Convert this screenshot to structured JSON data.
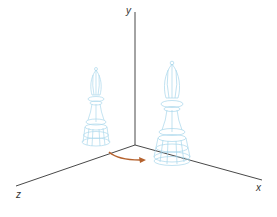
{
  "diagram": {
    "axes": {
      "x_label": "x",
      "y_label": "y",
      "z_label": "z",
      "color": "#333333"
    },
    "objects": [
      {
        "name": "bishop-original",
        "color": "#9fd3ea",
        "style": "wireframe"
      },
      {
        "name": "bishop-rotated",
        "color": "#9fd3ea",
        "style": "wireframe"
      }
    ],
    "arrow": {
      "color": "#b5622e",
      "meaning": "rotation"
    }
  }
}
